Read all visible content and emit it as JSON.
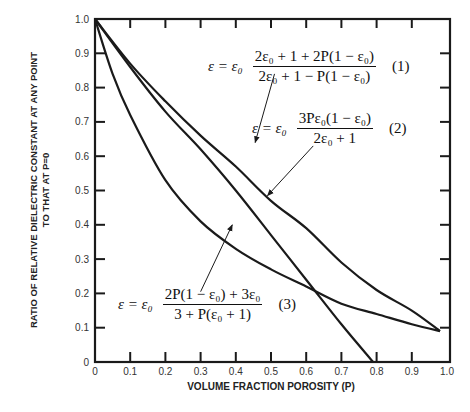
{
  "chart_data": {
    "type": "line",
    "title": "",
    "xlabel": "VOLUME FRACTION POROSITY (P)",
    "ylabel": "RATIO OF RELATIVE DIELECTRIC CONSTANT AT ANY POINT TO THAT AT P=0",
    "ylabel_lines": [
      "RATIO OF RELATIVE DIELECTRIC CONSTANT AT ANY POINT",
      "TO THAT AT P=0"
    ],
    "xlim": [
      0,
      1.0
    ],
    "ylim": [
      0,
      1.0
    ],
    "xticks": [
      "0",
      "0.1",
      "0.2",
      "0.3",
      "0.4",
      "0.5",
      "0.6",
      "0.7",
      "0.8",
      "0.9",
      "1.0"
    ],
    "yticks": [
      "0",
      "0.1",
      "0.2",
      "0.3",
      "0.4",
      "0.5",
      "0.6",
      "0.7",
      "0.8",
      "0.9",
      "1.0"
    ],
    "grid": false,
    "legend": "none (equations annotated with arrows)",
    "series": [
      {
        "name": "(1)",
        "equation": "ε = ε0 · (2ε0 + 1 + 2P(1 − ε0)) / (2ε0 + 1 − P(1 − ε0))",
        "x": [
          0,
          0.1,
          0.2,
          0.3,
          0.4,
          0.5,
          0.6,
          0.7,
          0.8,
          0.9,
          0.98
        ],
        "y": [
          1.0,
          0.87,
          0.76,
          0.66,
          0.57,
          0.47,
          0.39,
          0.29,
          0.21,
          0.15,
          0.09
        ]
      },
      {
        "name": "(2)",
        "equation": "ε = ε0 · 3Pε0(1 − ε0) / (2ε0 + 1)",
        "x": [
          0,
          0.1,
          0.2,
          0.3,
          0.4,
          0.5,
          0.6,
          0.7,
          0.79
        ],
        "y": [
          1.0,
          0.86,
          0.73,
          0.62,
          0.5,
          0.37,
          0.24,
          0.11,
          0.0
        ]
      },
      {
        "name": "(3)",
        "equation": "ε = ε0 · (2P(1 − ε0) + 3ε0) / (3 + P(ε0 + 1))",
        "x": [
          0,
          0.05,
          0.1,
          0.2,
          0.3,
          0.4,
          0.5,
          0.6,
          0.7,
          0.8,
          0.9,
          0.98
        ],
        "y": [
          1.0,
          0.84,
          0.72,
          0.53,
          0.41,
          0.33,
          0.27,
          0.22,
          0.17,
          0.14,
          0.11,
          0.09
        ]
      }
    ],
    "annotations": [
      {
        "label": "(1)",
        "arrow_from": [
          0.51,
          0.84
        ],
        "arrow_to": [
          0.455,
          0.64
        ]
      },
      {
        "label": "(2)",
        "arrow_from": [
          0.62,
          0.63
        ],
        "arrow_to": [
          0.49,
          0.485
        ]
      },
      {
        "label": "(3)",
        "arrow_from": [
          0.3,
          0.205
        ],
        "arrow_to": [
          0.39,
          0.4
        ]
      }
    ]
  },
  "equations": {
    "eq1": {
      "lhs": "ε = ε₀",
      "num": "2ε₀ + 1 + 2P(1 − ε₀)",
      "den": "2ε₀ + 1 − P(1 − ε₀)",
      "tag": "(1)"
    },
    "eq2": {
      "lhs": "ε = ε₀",
      "num": "3Pε₀(1 − ε₀)",
      "den": "2ε₀ + 1",
      "tag": "(2)"
    },
    "eq3": {
      "lhs": "ε = ε₀",
      "num": "2P(1 − ε₀) + 3ε₀",
      "den": "3 + P(ε₀ + 1)",
      "tag": "(3)"
    }
  },
  "colors": {
    "line": "#1a1a1a",
    "axis": "#1a1a1a",
    "background": "#ffffff"
  }
}
